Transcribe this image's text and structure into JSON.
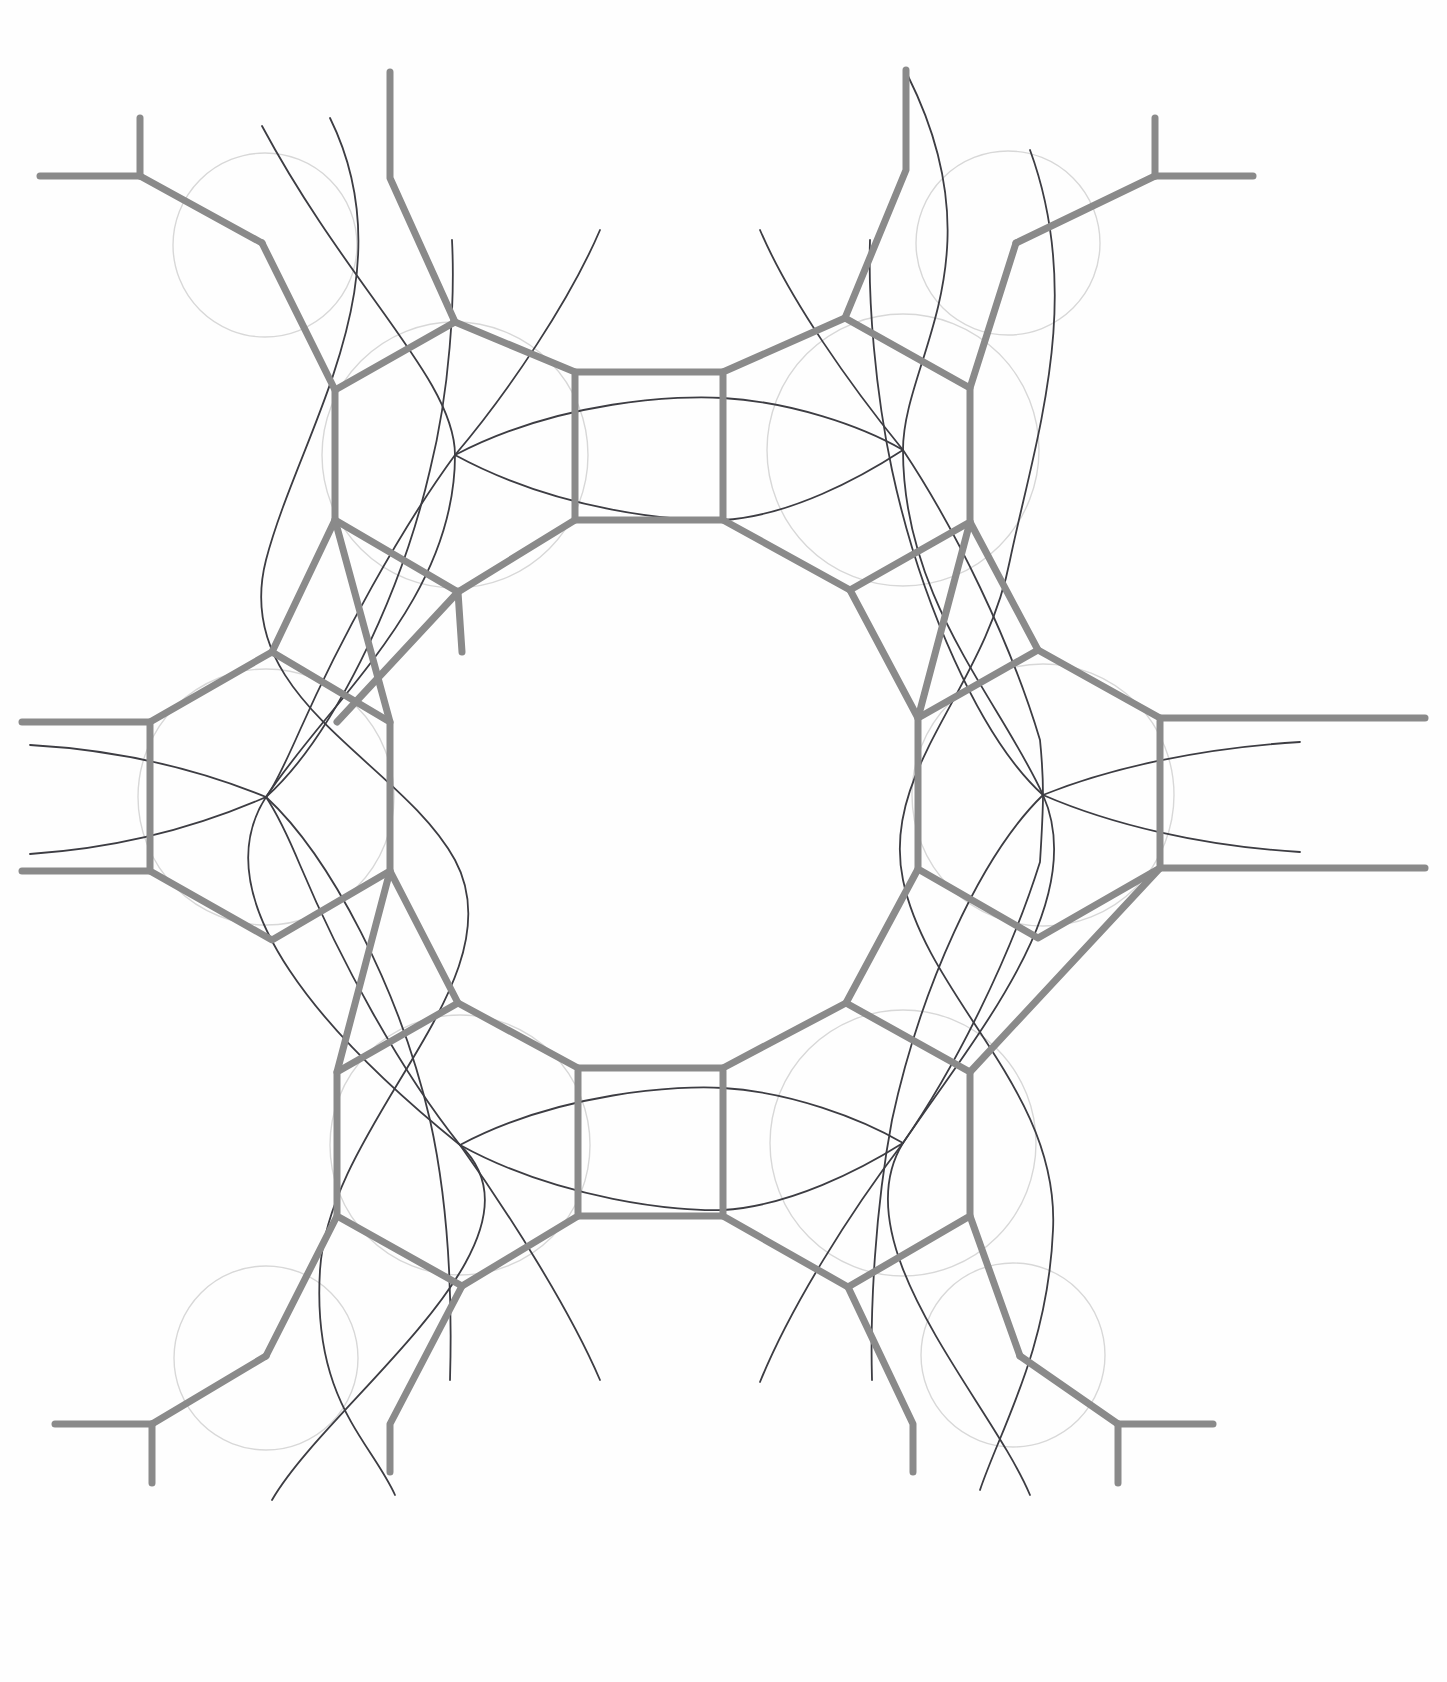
{
  "figure": {
    "medium": "hand-drawn pencil line drawing",
    "background_color": "#fefefe",
    "canvas": {
      "width": 1447,
      "height": 1682
    }
  },
  "style": {
    "bond_color": "#8a8a8a",
    "bond_width": 7,
    "bond_width_thin": 5,
    "guide_circle_color": "#d8d8d8",
    "guide_circle_width": 1.4,
    "guide_arc_color": "#3d3d43",
    "guide_arc_width": 1.8
  },
  "geometry": {
    "ring_center": {
      "x": 723,
      "y": 841
    },
    "node_radius_mean": 128,
    "node_count": 8,
    "central_void": "empty white octagonal region at image center"
  },
  "nodes": [
    {
      "id": "n-top-left",
      "label": "upper-left hexagon node",
      "cx": 455,
      "cy": 455,
      "r": 132,
      "rot": 0
    },
    {
      "id": "n-top-right",
      "label": "upper-right hexagon node",
      "cx": 903,
      "cy": 450,
      "r": 136,
      "rot": 0
    },
    {
      "id": "n-mid-left",
      "label": "left hexagon node",
      "cx": 266,
      "cy": 797,
      "r": 128,
      "rot": 0
    },
    {
      "id": "n-mid-right",
      "label": "right hexagon node",
      "cx": 1043,
      "cy": 795,
      "r": 131,
      "rot": 0
    },
    {
      "id": "n-bot-left",
      "label": "lower-left hexagon node",
      "cx": 460,
      "cy": 1145,
      "r": 130,
      "rot": 0
    },
    {
      "id": "n-bot-right",
      "label": "lower-right hexagon node",
      "cx": 903,
      "cy": 1143,
      "r": 133,
      "rot": 0
    },
    {
      "id": "n-upper-stub-l",
      "label": "upper-left outer junction",
      "cx": 265,
      "cy": 245,
      "r": 86,
      "rot": 0
    },
    {
      "id": "n-upper-stub-r",
      "label": "upper-right outer junction",
      "cx": 1008,
      "cy": 243,
      "r": 86,
      "rot": 0
    },
    {
      "id": "n-lower-stub-l",
      "label": "lower-left outer junction",
      "cx": 266,
      "cy": 1358,
      "r": 86,
      "rot": 0
    },
    {
      "id": "n-lower-stub-r",
      "label": "lower-right outer junction",
      "cx": 1013,
      "cy": 1355,
      "r": 86,
      "rot": 0
    }
  ],
  "bonds": [
    {
      "id": "b-top-square",
      "label": "top connecting square",
      "d": "M578 372 L723 372 L723 372"
    },
    {
      "id": "b-bottom-square",
      "label": "bottom connecting square",
      "d": "M578 1068 L723 1068"
    }
  ],
  "terminals": [
    {
      "id": "t-top-left",
      "label": "top-left T terminal",
      "x": 40,
      "y": 176,
      "dir": "left"
    },
    {
      "id": "t-top-right",
      "label": "top-right T terminal",
      "x": 1164,
      "y": 176,
      "dir": "right"
    },
    {
      "id": "t-left-upper",
      "label": "left upper terminal",
      "x": 22,
      "y": 722,
      "dir": "left"
    },
    {
      "id": "t-left-lower",
      "label": "left lower terminal",
      "x": 22,
      "y": 871,
      "dir": "left"
    },
    {
      "id": "t-right-upper",
      "label": "right upper terminal",
      "x": 1425,
      "y": 718,
      "dir": "right"
    },
    {
      "id": "t-right-lower",
      "label": "right lower terminal",
      "x": 1425,
      "y": 869,
      "dir": "right"
    },
    {
      "id": "t-bottom-left",
      "label": "bottom-left T terminal",
      "x": 55,
      "y": 1424,
      "dir": "left"
    },
    {
      "id": "t-bottom-right",
      "label": "bottom-right T terminal",
      "x": 1213,
      "y": 1424,
      "dir": "right"
    },
    {
      "id": "t-top-stem-l",
      "label": "top-left vertical stem",
      "x": 390,
      "y": 72,
      "dir": "up"
    },
    {
      "id": "t-top-stem-r",
      "label": "top-right vertical stem",
      "x": 906,
      "y": 70,
      "dir": "up"
    },
    {
      "id": "t-bot-stem-l",
      "label": "bottom-left vertical stem",
      "x": 390,
      "y": 1470,
      "dir": "down"
    },
    {
      "id": "t-bot-stem-r",
      "label": "bottom-right vertical stem",
      "x": 913,
      "y": 1470,
      "dir": "down"
    }
  ],
  "guide_arcs": {
    "count": 12,
    "description": "thin dark pencil arcs sweeping through node centers, three meeting at each hexagon centre"
  },
  "guide_circles": {
    "count": 10,
    "description": "faint construction circles circumscribing each hexagonal node"
  }
}
